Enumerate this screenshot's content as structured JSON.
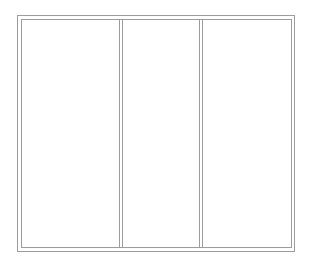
{
  "frame": {
    "line_color": "#9c9c9c",
    "background": "#ffffff",
    "outer": {
      "left": 17,
      "top": 15,
      "right": 294,
      "bottom": 251
    },
    "inner": {
      "left": 21,
      "top": 19,
      "right": 291,
      "bottom": 247
    }
  },
  "dividers": [
    {
      "x1": 119,
      "x2": 122
    },
    {
      "x1": 199,
      "x2": 202
    }
  ],
  "panels": [
    {
      "name": "left-panel",
      "content": ""
    },
    {
      "name": "middle-panel",
      "content": ""
    },
    {
      "name": "right-panel",
      "content": ""
    }
  ]
}
